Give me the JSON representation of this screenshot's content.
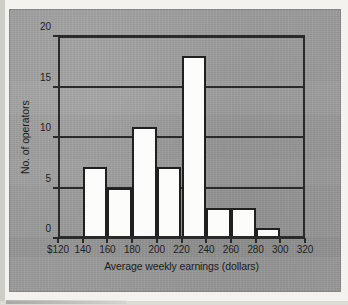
{
  "figure": {
    "background_color": "#9b9b9b",
    "page_color": "#f3f2ef",
    "axis_color": "#2a2a2a",
    "bar_fill_color": "#fcfcfa",
    "bar_edge_color": "#202020"
  },
  "chart_data": {
    "type": "bar",
    "title": "",
    "subtitle": "",
    "xlabel": "Average weekly earnings (dollars)",
    "ylabel": "No. of operators",
    "xlim": [
      120,
      320
    ],
    "ylim": [
      0,
      20
    ],
    "grid": true,
    "legend": null,
    "legend_position": "none",
    "bin_width": 20,
    "x_tick_labels": [
      "$120",
      "140",
      "160",
      "180",
      "200",
      "220",
      "240",
      "260",
      "280",
      "300",
      "320"
    ],
    "x_tick_values": [
      120,
      140,
      160,
      180,
      200,
      220,
      240,
      260,
      280,
      300,
      320
    ],
    "y_tick_labels": [
      "0",
      "5",
      "10",
      "15",
      "20"
    ],
    "y_tick_values": [
      0,
      5,
      10,
      15,
      20
    ],
    "bins": [
      {
        "label": "120-140",
        "start": 120,
        "end": 140,
        "value": 0
      },
      {
        "label": "140-160",
        "start": 140,
        "end": 160,
        "value": 7
      },
      {
        "label": "160-180",
        "start": 160,
        "end": 180,
        "value": 5
      },
      {
        "label": "180-200",
        "start": 180,
        "end": 200,
        "value": 11
      },
      {
        "label": "200-220",
        "start": 200,
        "end": 220,
        "value": 7
      },
      {
        "label": "220-240",
        "start": 220,
        "end": 240,
        "value": 18
      },
      {
        "label": "240-260",
        "start": 240,
        "end": 260,
        "value": 3
      },
      {
        "label": "260-280",
        "start": 260,
        "end": 280,
        "value": 3
      },
      {
        "label": "280-300",
        "start": 280,
        "end": 300,
        "value": 1
      },
      {
        "label": "300-320",
        "start": 300,
        "end": 320,
        "value": 0
      }
    ],
    "categories": [
      "120-140",
      "140-160",
      "160-180",
      "180-200",
      "200-220",
      "220-240",
      "240-260",
      "260-280",
      "280-300",
      "300-320"
    ],
    "values": [
      0,
      7,
      5,
      11,
      7,
      18,
      3,
      3,
      1,
      0
    ]
  }
}
